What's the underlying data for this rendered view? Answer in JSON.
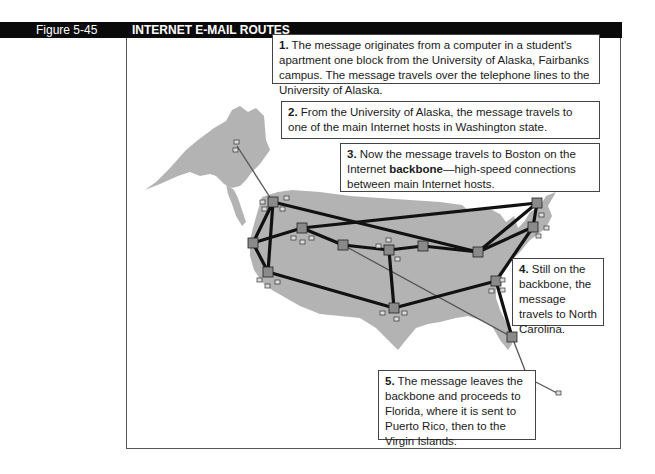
{
  "header": {
    "figure_label": "Figure 5-45",
    "title": "INTERNET E-MAIL ROUTES"
  },
  "callouts": [
    {
      "number": "1.",
      "text": " The message originates from a computer in a student's apartment one block from the University of Alaska, Fairbanks campus. The message travels over the telephone lines to the University of Alaska."
    },
    {
      "number": "2.",
      "text": " From the University of Alaska, the message travels to one of the main Internet hosts in Washington state."
    },
    {
      "number": "3.",
      "text_before": " Now the message travels to Boston on the Internet ",
      "bold_term": "backbone",
      "text_after": "—high-speed connections between main Internet hosts."
    },
    {
      "number": "4.",
      "text": " Still on the backbone, the message travels to North Carolina."
    },
    {
      "number": "5.",
      "text": " The message leaves the backbone and proceeds to Florida, where it is sent to Puerto Rico, then to the Virgin Islands."
    }
  ],
  "map": {
    "land_color": "#b3b3b3",
    "backbone_color": "#111111",
    "route_color": "#555555",
    "node_icon": "server-icon",
    "client_icon": "computer-icon"
  }
}
